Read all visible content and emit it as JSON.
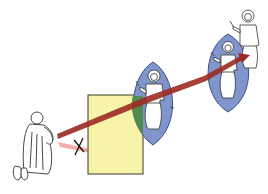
{
  "diagram": {
    "colors": {
      "background": "#ffffff",
      "panel_fill": "#f7f3a8",
      "panel_stroke": "#3a3a2a",
      "mandorla_fill": "#7f95cc",
      "mandorla_stroke": "#3f4f86",
      "overlap_fill": "#4f8a4a",
      "gaze_ray": "#9b2a22",
      "blocked_ray": "#f08a80",
      "line_art": "#333333"
    },
    "elements": {
      "worshipper": "kneeling-figure",
      "panel": "material-image-panel",
      "icon": "christ-mandorla-icon",
      "prototype": "christ-in-glory-mandorla",
      "heavenly_figure": "standing-christ-figure",
      "cross_mark": "X"
    }
  }
}
